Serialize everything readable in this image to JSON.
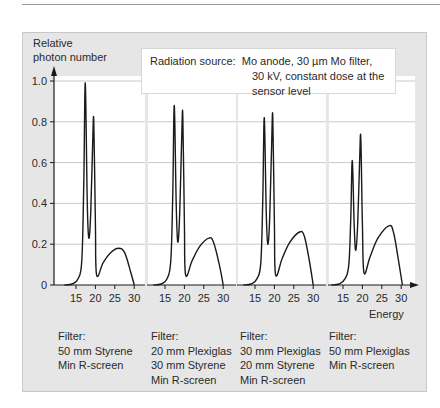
{
  "figure": {
    "y_axis_title_line1": "Relative",
    "y_axis_title_line2": "photon number",
    "x_axis_title": "Energy",
    "source_label": "Radiation source:",
    "source_line1": "Mo anode, 30 µm Mo filter,",
    "source_line2": "30 kV, constant dose at the sensor level",
    "y_ticks": [
      "0",
      "0.2",
      "0.4",
      "0.6",
      "0.8",
      "1.0"
    ],
    "x_ticks": [
      "15",
      "20",
      "25",
      "30"
    ],
    "panels": [
      {
        "filter_label": "Filter:",
        "lines": [
          "50 mm Styrene",
          "Min R-screen"
        ]
      },
      {
        "filter_label": "Filter:",
        "lines": [
          "20 mm Plexiglas",
          "30 mm Styrene",
          "Min R-screen"
        ]
      },
      {
        "filter_label": "Filter:",
        "lines": [
          "30 mm Plexiglas",
          "20 mm Styrene",
          "Min R-screen"
        ]
      },
      {
        "filter_label": "Filter:",
        "lines": [
          "50 mm Plexiglas",
          "Min R-screen"
        ]
      }
    ]
  },
  "chart_data": {
    "type": "line",
    "xlabel": "Energy",
    "ylabel": "Relative photon number",
    "ylim": [
      0,
      1.0
    ],
    "xlim": [
      10,
      31
    ],
    "x_ticks": [
      15,
      20,
      25,
      30
    ],
    "y_ticks": [
      0,
      0.2,
      0.4,
      0.6,
      0.8,
      1.0
    ],
    "grid": "horizontal",
    "layout": "4 side-by-side panels sharing y axis",
    "series": [
      {
        "name": "Filter: 50 mm Styrene, Min R-screen",
        "x": [
          12,
          14,
          15.5,
          16.5,
          17.0,
          17.4,
          17.9,
          18.3,
          18.8,
          19.3,
          19.6,
          20.0,
          20.3,
          22,
          24,
          26,
          27.5,
          29,
          30
        ],
        "y": [
          0,
          0.005,
          0.03,
          0.12,
          0.5,
          0.99,
          0.4,
          0.23,
          0.35,
          0.7,
          0.8,
          0.3,
          0.05,
          0.11,
          0.16,
          0.18,
          0.16,
          0.07,
          0
        ]
      },
      {
        "name": "Filter: 20 mm Plexiglas, 30 mm Styrene, Min R-screen",
        "x": [
          12,
          14,
          15.5,
          16.5,
          17.0,
          17.4,
          17.9,
          18.3,
          18.8,
          19.3,
          19.6,
          20.0,
          20.3,
          22,
          24,
          26.3,
          27.5,
          29,
          30
        ],
        "y": [
          0,
          0.005,
          0.03,
          0.12,
          0.45,
          0.88,
          0.38,
          0.21,
          0.35,
          0.72,
          0.83,
          0.3,
          0.05,
          0.12,
          0.19,
          0.23,
          0.21,
          0.1,
          0
        ]
      },
      {
        "name": "Filter: 30 mm Plexiglas, 20 mm Styrene, Min R-screen",
        "x": [
          12,
          14,
          15.5,
          16.5,
          17.0,
          17.4,
          17.9,
          18.3,
          18.8,
          19.3,
          19.6,
          20.0,
          20.3,
          22,
          24,
          26.5,
          27.7,
          29,
          30
        ],
        "y": [
          0,
          0.005,
          0.03,
          0.11,
          0.42,
          0.82,
          0.35,
          0.2,
          0.33,
          0.7,
          0.82,
          0.3,
          0.05,
          0.13,
          0.21,
          0.26,
          0.24,
          0.12,
          0
        ]
      },
      {
        "name": "Filter: 50 mm Plexiglas, Min R-screen",
        "x": [
          12,
          14,
          15.5,
          16.5,
          17.0,
          17.4,
          17.9,
          18.3,
          18.8,
          19.3,
          19.6,
          20.0,
          20.4,
          22,
          24,
          26.8,
          28,
          29.3,
          30.3
        ],
        "y": [
          0,
          0.005,
          0.03,
          0.1,
          0.33,
          0.61,
          0.28,
          0.17,
          0.3,
          0.62,
          0.72,
          0.3,
          0.06,
          0.14,
          0.23,
          0.29,
          0.26,
          0.12,
          0
        ]
      }
    ]
  }
}
